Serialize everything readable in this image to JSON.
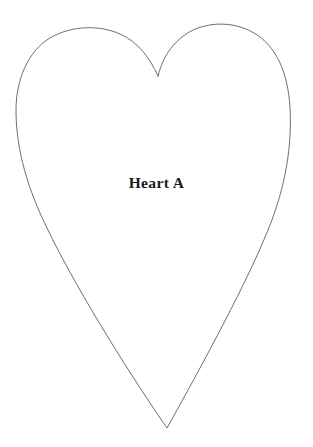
{
  "page": {
    "background_color": "#ffffff",
    "width": 313,
    "height": 447,
    "document_type": "craft-template-outline"
  },
  "template": {
    "label": "Heart A",
    "label_color": "#1a1a1a",
    "shape_name": "heart-outline",
    "stroke_color": "#6e6e6e",
    "stroke_width": 1,
    "fill": "none",
    "geometry": {
      "cleft_point": [
        158,
        76
      ],
      "bottom_tip": [
        167,
        428
      ],
      "left_lobe_peak": [
        85,
        31
      ],
      "right_lobe_peak": [
        235,
        28
      ],
      "leftmost_point": [
        16,
        128
      ],
      "rightmost_point": [
        290,
        105
      ]
    },
    "path": "M 158 76 C 150 58 138 42 120 34 C 100 25 72 25 50 38 C 28 51 16 80 16 110 C 16 150 28 190 48 230 C 72 280 120 360 167 428 C 205 360 248 280 268 230 C 286 186 292 145 290 108 C 288 72 276 46 254 33 C 232 20 204 22 186 34 C 170 45 162 60 158 76 Z"
  }
}
